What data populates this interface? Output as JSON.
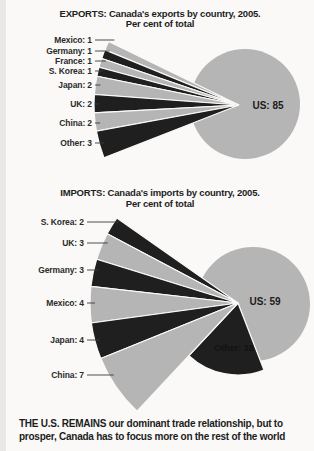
{
  "page": {
    "background": "#faf9f7",
    "caption": {
      "line1": "THE U.S. REMAINS our dominant trade relationship, but to",
      "line2": "prosper, Canada has to focus more on the rest of the world"
    }
  },
  "colors": {
    "light_slice": "#b5b5b5",
    "dark_slice": "#1f1f1f",
    "separator": "#fbfaf8",
    "text": "#1d1d1d",
    "inner_label_text": "#121212",
    "leader_line": "#3a3a3a"
  },
  "chart_data": [
    {
      "type": "pie",
      "name": "exports",
      "title": "EXPORTS: Canada's exports by country, 2005.",
      "subtitle": "Per cent of total",
      "value_unit": "per cent of total",
      "label_format": "{label}: {value}",
      "legend_position": "left-labels",
      "slices": [
        {
          "label": "Mexico",
          "value": 1,
          "shade": "light"
        },
        {
          "label": "Germany",
          "value": 1,
          "shade": "dark"
        },
        {
          "label": "France",
          "value": 1,
          "shade": "light"
        },
        {
          "label": "S. Korea",
          "value": 1,
          "shade": "dark"
        },
        {
          "label": "Japan",
          "value": 2,
          "shade": "light"
        },
        {
          "label": "UK",
          "value": 2,
          "shade": "dark"
        },
        {
          "label": "China",
          "value": 2,
          "shade": "light"
        },
        {
          "label": "Other",
          "value": 3,
          "shade": "dark"
        },
        {
          "label": "US",
          "value": 85,
          "shade": "light"
        }
      ]
    },
    {
      "type": "pie",
      "name": "imports",
      "title": "IMPORTS: Canada's imports by country, 2005.",
      "subtitle": "Per cent of total",
      "value_unit": "per cent of total",
      "label_format": "{label}: {value}",
      "legend_position": "left-labels",
      "slices": [
        {
          "label": "S. Korea",
          "value": 2,
          "shade": "dark"
        },
        {
          "label": "UK",
          "value": 3,
          "shade": "light"
        },
        {
          "label": "Germany",
          "value": 3,
          "shade": "dark"
        },
        {
          "label": "Mexico",
          "value": 4,
          "shade": "light"
        },
        {
          "label": "Japan",
          "value": 4,
          "shade": "dark"
        },
        {
          "label": "China",
          "value": 7,
          "shade": "light"
        },
        {
          "label": "Other",
          "value": 18,
          "shade": "dark"
        },
        {
          "label": "US",
          "value": 59,
          "shade": "light"
        }
      ]
    }
  ]
}
